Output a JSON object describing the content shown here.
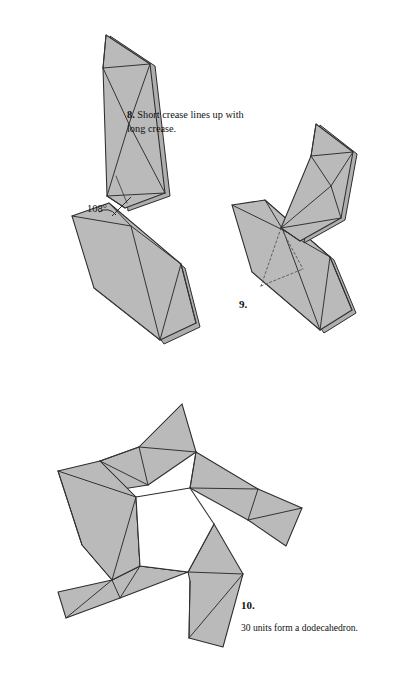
{
  "page": {
    "kind": "origami-instruction-figure",
    "background_color": "#ffffff",
    "width": 404,
    "height": 688
  },
  "style": {
    "paper_fill": "#b9b9b9",
    "paper_fill_light": "#c6c6c6",
    "paper_fill_dark": "#ababab",
    "edge_stroke": "#2b2b2b",
    "crease_stroke": "#3a3a3a",
    "hidden_stroke": "#6d6d6d",
    "hole_fill": "#ffffff"
  },
  "steps": [
    {
      "id": "step-8",
      "number": "8.",
      "caption": "Short crease lines up with long crease.",
      "annotation": {
        "label": "108°",
        "value": 108,
        "unit": "degrees"
      }
    },
    {
      "id": "step-9",
      "number": "9.",
      "caption": ""
    },
    {
      "id": "step-10",
      "number": "10.",
      "caption": "30 units form a dodecahedron.",
      "unit_count": 30,
      "polyhedron": "dodecahedron"
    }
  ],
  "figure_8": {
    "name": "two-units-joined-at-108-degrees",
    "upper_unit": {
      "outline": "106,35 150,64 165,193 125,208 107,196 103,68",
      "back_layer": "110,36 155,66 170,196 128,211",
      "creases": [
        "106,35 150,64",
        "106,35 103,68",
        "103,68 150,64",
        "150,64 129,124",
        "103,68 129,124",
        "129,124 165,193",
        "129,124 107,196",
        "107,196 165,193",
        "125,208 165,193",
        "107,196 125,208"
      ],
      "small_crease": "116,176 127,203"
    },
    "lower_unit": {
      "outline": "72,216 109,203 181,264 196,323 160,340 94,288",
      "back_layer": "76,220 112,206 185,268 200,327 164,344",
      "creases": [
        "72,216 109,203",
        "109,203 131,226",
        "72,216 131,226",
        "131,226 181,264",
        "131,226 160,340",
        "160,340 181,264",
        "181,264 196,323",
        "160,340 196,323"
      ]
    },
    "angle_mark": {
      "vertex": "110,207",
      "arc": "M 101,214 A 13,13 0 0 1 118,216",
      "leader": "112,216 132,196"
    }
  },
  "figure_9": {
    "name": "units-interlocked",
    "upper_unit": {
      "outline": "316,124 353,152 341,218 300,241 281,228 311,156",
      "back_layer": "320,125 357,154 345,220 304,243",
      "creases": [
        "316,124 353,152",
        "316,124 311,156",
        "311,156 353,152",
        "353,152 331,186",
        "311,156 331,186",
        "331,186 341,218",
        "331,186 281,228",
        "281,228 341,218",
        "300,241 341,218",
        "281,228 300,241"
      ]
    },
    "lower_unit": {
      "outline": "232,205 265,200 330,257 352,310 320,330 252,272",
      "back_layer": "236,208 268,203 334,260 356,313 324,333",
      "creases": [
        "232,205 265,200",
        "265,200 283,230",
        "232,205 283,230",
        "283,230 330,257",
        "283,230 320,330",
        "320,330 330,257",
        "330,257 352,310",
        "320,330 352,310"
      ]
    },
    "hidden_creases": [
      "281,228 262,285",
      "281,228 302,268",
      "262,285 302,268"
    ]
  },
  "figure_10": {
    "name": "five-units-pinwheel-pentagon",
    "center_hole": "136,497 190,488 214,524 188,572 140,566",
    "units": [
      {
        "id": "unit-top",
        "outline": "182,404 196,452 148,485 97,493 100,461 139,447",
        "creases": [
          "182,404 139,447",
          "182,404 196,452",
          "139,447 196,452",
          "196,452 148,485",
          "139,447 148,485",
          "139,447 100,461",
          "100,461 148,485",
          "97,493 100,461"
        ]
      },
      {
        "id": "unit-upper-right",
        "outline": "196,452 258,489 302,508 286,546 248,520 190,488",
        "creases": [
          "196,452 190,488",
          "196,452 258,489",
          "190,488 258,489",
          "258,489 302,508",
          "258,489 248,520",
          "248,520 302,508",
          "302,508 286,546",
          "248,520 286,546"
        ]
      },
      {
        "id": "unit-right-lower",
        "outline": "214,524 243,574 223,647 189,638 190,581 188,572",
        "creases": [
          "214,524 188,572",
          "214,524 243,574",
          "188,572 243,574",
          "243,574 223,647",
          "243,574 189,638",
          "189,638 223,647",
          "190,581 189,638"
        ]
      },
      {
        "id": "unit-bottom-left",
        "outline": "188,572 120,598 66,618 58,592 112,580 140,566",
        "creases": [
          "188,572 140,566",
          "188,572 120,598",
          "140,566 120,598",
          "120,598 66,618",
          "120,598 112,580",
          "112,580 66,618",
          "58,592 112,580",
          "66,618 58,592"
        ]
      },
      {
        "id": "unit-left",
        "outline": "100,461 136,497 140,566 112,580 82,545 58,471",
        "creases": [
          "100,461 136,497",
          "100,461 58,471",
          "58,471 136,497",
          "136,497 140,566",
          "136,497 112,580",
          "112,580 140,566",
          "58,471 82,545",
          "82,545 112,580"
        ]
      }
    ]
  }
}
